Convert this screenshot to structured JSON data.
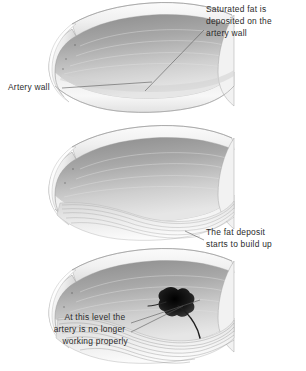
{
  "figure": {
    "background_color": "#ffffff",
    "text_color": "#2b2b2b",
    "leader_line_color": "#5a5a5a"
  },
  "callouts": [
    {
      "id": "saturated-fat",
      "lines": [
        "Saturated fat is",
        "deposited on the",
        "artery wall"
      ],
      "align": "left",
      "x": 206,
      "y": 10
    },
    {
      "id": "artery-wall",
      "lines": [
        "Artery wall"
      ],
      "align": "left",
      "x": 8,
      "y": 88
    },
    {
      "id": "fat-deposit",
      "lines": [
        "The fat deposit",
        "starts to build up"
      ],
      "align": "left",
      "x": 206,
      "y": 233
    },
    {
      "id": "not-working",
      "lines": [
        "At this level the",
        "artery is no longer",
        "working properly"
      ],
      "align": "right",
      "x": 128,
      "y": 318
    }
  ],
  "panels": [
    {
      "id": "panel-healthy",
      "label": "healthy artery segment",
      "stage": "normal",
      "offset_y": 0,
      "deposit_level": 0,
      "has_blockage": false
    },
    {
      "id": "panel-narrowing",
      "label": "artery with fat deposit building up",
      "stage": "narrowing",
      "offset_y": 123,
      "deposit_level": 1,
      "has_blockage": false
    },
    {
      "id": "panel-blocked",
      "label": "artery no longer working properly",
      "stage": "blocked",
      "offset_y": 246,
      "deposit_level": 2,
      "has_blockage": true
    }
  ],
  "colors": {
    "lumen_dark": "#8c8c8c",
    "lumen_mid": "#b4b4b4",
    "lumen_light": "#dedede",
    "wall_outer": "#f4f4f4",
    "wall_edge": "#9a9a9a",
    "fat_streak": "#9e9e9e",
    "blockage": "#151515"
  }
}
